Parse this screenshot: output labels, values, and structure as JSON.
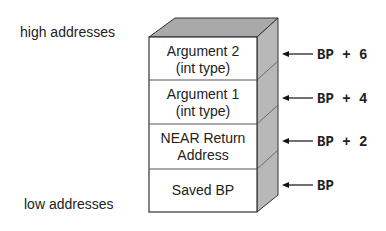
{
  "labels": {
    "high": "high addresses",
    "low": "low addresses"
  },
  "stack": {
    "cells": [
      {
        "line1": "Argument 2",
        "line2": "(int type)",
        "pointer": "BP + 6"
      },
      {
        "line1": "Argument 1",
        "line2": "(int type)",
        "pointer": "BP + 4"
      },
      {
        "line1": "NEAR Return",
        "line2": "Address",
        "pointer": "BP + 2"
      },
      {
        "line1": "Saved BP",
        "line2": "",
        "pointer": "BP"
      }
    ]
  },
  "colors": {
    "face": "#ffffff",
    "top": "#a9a9a9",
    "side": "#b8b8b8",
    "stroke": "#333333"
  }
}
